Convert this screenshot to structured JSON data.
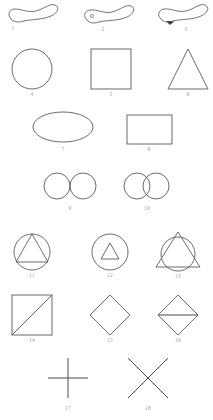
{
  "figure": {
    "background_color": "#ffffff",
    "stroke_color": "#5a5a5a",
    "label_color": "#9a9a9a",
    "item_count": 18
  },
  "items": [
    {
      "number": "1",
      "shape_name": "open-blob-curve"
    },
    {
      "number": "2",
      "shape_name": "blob-curve-with-dot"
    },
    {
      "number": "3",
      "shape_name": "blob-curve-with-arrow"
    },
    {
      "number": "4",
      "shape_name": "circle"
    },
    {
      "number": "5",
      "shape_name": "square"
    },
    {
      "number": "6",
      "shape_name": "triangle"
    },
    {
      "number": "7",
      "shape_name": "ellipse"
    },
    {
      "number": "8",
      "shape_name": "rectangle"
    },
    {
      "number": "9",
      "shape_name": "two-tangent-circles"
    },
    {
      "number": "10",
      "shape_name": "two-overlapping-circles"
    },
    {
      "number": "11",
      "shape_name": "triangle-inscribed-in-circle"
    },
    {
      "number": "12",
      "shape_name": "small-triangle-inside-circle"
    },
    {
      "number": "13",
      "shape_name": "triangle-overlapping-circle"
    },
    {
      "number": "14",
      "shape_name": "square-with-diagonal"
    },
    {
      "number": "15",
      "shape_name": "diamond"
    },
    {
      "number": "16",
      "shape_name": "diamond-with-horizontal-line"
    },
    {
      "number": "17",
      "shape_name": "plus-cross"
    },
    {
      "number": "18",
      "shape_name": "x-cross"
    }
  ]
}
